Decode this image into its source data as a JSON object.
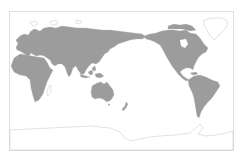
{
  "map": {
    "projection": "Pacific-centered world map",
    "colors": {
      "land": "#9c9c9c",
      "outline_only_land": "#ffffff",
      "outline": "#c4c4c4",
      "ocean": "#ffffff",
      "frame": "#d8d8d8"
    },
    "filled_regions": [
      "Eurasia",
      "Africa",
      "Australia",
      "North America",
      "South America",
      "New Zealand",
      "Japan",
      "Southeast Asia islands"
    ],
    "outlined_regions": [
      "Greenland",
      "Antarctica",
      "Madagascar"
    ]
  }
}
